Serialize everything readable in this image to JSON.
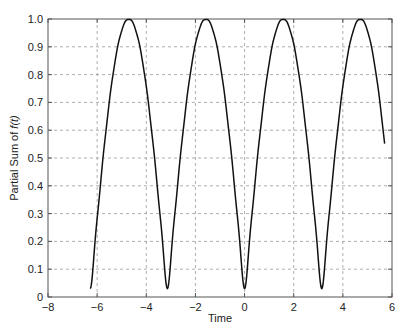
{
  "chart_data": {
    "type": "line",
    "title": "",
    "xlabel": "Time",
    "ylabel": "Partial Sum of f(t)",
    "ylabel_parts": {
      "prefix": "Partial Sum of ",
      "func": "f(t)"
    },
    "xlim": [
      -8,
      6
    ],
    "ylim": [
      0,
      1
    ],
    "xticks": [
      -8,
      -6,
      -4,
      -2,
      0,
      2,
      4,
      6
    ],
    "xtick_labels": [
      "−8",
      "−6",
      "−4",
      "−2",
      "0",
      "2",
      "4",
      "6"
    ],
    "yticks": [
      0,
      0.1,
      0.2,
      0.3,
      0.4,
      0.5,
      0.6,
      0.7,
      0.8,
      0.9,
      1.0
    ],
    "ytick_labels": [
      "0",
      "0.1",
      "0.2",
      "0.3",
      "0.4",
      "0.5",
      "0.6",
      "0.7",
      "0.8",
      "0.9",
      "1.0"
    ],
    "grid": true,
    "legend": null,
    "series": [
      {
        "name": "Partial Sum of f(t)",
        "description": "Fourier partial sum approximating |sin(t)|",
        "t_range": [
          -6.28,
          5.7
        ],
        "fourier_terms": 10,
        "color": "#111111",
        "sample_points": {
          "x": [
            -6.28,
            -4.71,
            -3.14,
            -1.57,
            0,
            1.57,
            3.14,
            4.71,
            5.7
          ],
          "y": [
            0.03,
            1.0,
            0.03,
            1.0,
            0.03,
            1.0,
            0.03,
            1.0,
            0.54
          ]
        }
      }
    ]
  },
  "colors": {
    "axis": "#555555",
    "grid": "#999999",
    "line": "#111111",
    "background": "#ffffff"
  }
}
